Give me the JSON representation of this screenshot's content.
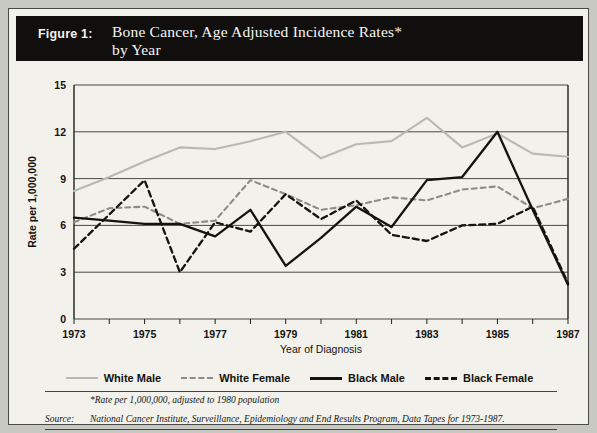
{
  "figure": {
    "number_label": "Figure 1:",
    "title_line1": "Bone Cancer, Age Adjusted Incidence Rates*",
    "title_line2": "by Year"
  },
  "legend": {
    "items": [
      {
        "label": "White Male",
        "key": "white-male",
        "color": "#b9b9b4",
        "style": "solid"
      },
      {
        "label": "White Female",
        "key": "white-female",
        "color": "#8d8d88",
        "style": "dashed"
      },
      {
        "label": "Black Male",
        "key": "black-male",
        "color": "#14130f",
        "style": "solid"
      },
      {
        "label": "Black Female",
        "key": "black-female",
        "color": "#14130f",
        "style": "dashed"
      }
    ]
  },
  "notes": {
    "footnote": "*Rate per 1,000,000, adjusted to 1980 population",
    "source_label": "Source:",
    "source_text": "National Cancer Institute, Surveillance, Epidemiology and End Results Program, Data Tapes for 1973-1987."
  },
  "chart_data": {
    "type": "line",
    "title": "Bone Cancer, Age Adjusted Incidence Rates* by Year",
    "xlabel": "Year of Diagnosis",
    "ylabel": "Rate per 1,000,000",
    "xlim": [
      1973,
      1987
    ],
    "ylim": [
      0,
      15
    ],
    "yticks": [
      0,
      3,
      6,
      9,
      12,
      15
    ],
    "xticks": [
      1973,
      1974,
      1975,
      1976,
      1977,
      1978,
      1979,
      1980,
      1981,
      1982,
      1983,
      1984,
      1985,
      1986,
      1987
    ],
    "xticklabels": [
      "1973",
      "",
      "1975",
      "",
      "1977",
      "",
      "1979",
      "",
      "1981",
      "",
      "1983",
      "",
      "1985",
      "",
      "1987"
    ],
    "grid": true,
    "legend_position": "below",
    "x": [
      1973,
      1974,
      1975,
      1976,
      1977,
      1978,
      1979,
      1980,
      1981,
      1982,
      1983,
      1984,
      1985,
      1986,
      1987
    ],
    "series": [
      {
        "name": "White Male",
        "color": "#b9b9b4",
        "style": "solid",
        "values": [
          8.2,
          9.1,
          10.1,
          11.0,
          10.9,
          11.4,
          12.0,
          10.3,
          11.2,
          11.4,
          12.9,
          11.0,
          11.9,
          10.6,
          10.4
        ]
      },
      {
        "name": "White Female",
        "color": "#8d8d88",
        "style": "dashed",
        "values": [
          6.2,
          7.1,
          7.2,
          6.1,
          6.3,
          8.9,
          8.0,
          7.0,
          7.3,
          7.8,
          7.6,
          8.3,
          8.5,
          7.1,
          7.7
        ]
      },
      {
        "name": "Black Male",
        "color": "#14130f",
        "style": "solid",
        "values": [
          6.5,
          6.3,
          6.1,
          6.1,
          5.3,
          7.0,
          3.4,
          5.2,
          7.2,
          5.9,
          8.9,
          9.1,
          12.0,
          7.0,
          2.2
        ]
      },
      {
        "name": "Black Female",
        "color": "#14130f",
        "style": "dashed",
        "values": [
          4.5,
          6.7,
          8.9,
          3.0,
          6.2,
          5.6,
          8.0,
          6.4,
          7.6,
          5.4,
          5.0,
          6.0,
          6.1,
          7.2,
          2.3
        ]
      }
    ]
  }
}
